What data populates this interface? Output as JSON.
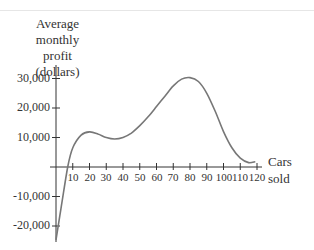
{
  "chart_data": {
    "type": "line",
    "title": "",
    "ylabel": "Average monthly profit (dollars)",
    "ylabel_lines": [
      "Average",
      "monthly profit",
      "(dollars)"
    ],
    "xlabel": "Cars sold",
    "xlabel_lines": [
      "Cars",
      "sold"
    ],
    "xlim": [
      0,
      120
    ],
    "ylim": [
      -25000,
      33000
    ],
    "grid": false,
    "legend": null,
    "x_ticks": [
      10,
      20,
      30,
      40,
      50,
      60,
      70,
      80,
      90,
      100,
      110,
      120
    ],
    "x_tick_labels": [
      "10",
      "20",
      "30",
      "40",
      "50",
      "60",
      "70",
      "80",
      "90",
      "100",
      "110",
      "120"
    ],
    "y_ticks": [
      30000,
      20000,
      10000,
      -10000,
      -20000
    ],
    "y_tick_labels": [
      "30,000",
      "20,000",
      "10,000",
      "-10,000",
      "-20,000"
    ],
    "series": [
      {
        "name": "Average monthly profit",
        "color": "#777777",
        "x": [
          0,
          3,
          7,
          10,
          15,
          20,
          25,
          30,
          35,
          40,
          45,
          50,
          55,
          60,
          65,
          70,
          75,
          80,
          85,
          90,
          95,
          100,
          105,
          110,
          115,
          119
        ],
        "y": [
          -24700,
          -14000,
          0,
          6500,
          10800,
          11900,
          11200,
          10000,
          9500,
          10000,
          11500,
          14000,
          17000,
          20500,
          24000,
          27500,
          29800,
          30300,
          29000,
          25000,
          19000,
          12000,
          6500,
          3000,
          1500,
          1800
        ]
      }
    ]
  }
}
